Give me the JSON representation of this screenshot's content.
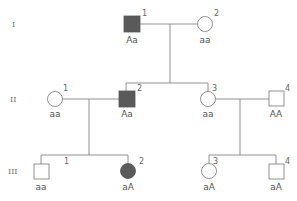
{
  "generations": [
    {
      "label": "I"
    },
    {
      "label": "II"
    },
    {
      "label": "III"
    }
  ],
  "individuals": {
    "I1": {
      "number": "1",
      "sex": "male",
      "affected": true,
      "genotype": "Aa"
    },
    "I2": {
      "number": "2",
      "sex": "female",
      "affected": false,
      "genotype": "aa"
    },
    "II1": {
      "number": "1",
      "sex": "female",
      "affected": false,
      "genotype": "aa"
    },
    "II2": {
      "number": "2",
      "sex": "male",
      "affected": true,
      "genotype": "Aa"
    },
    "II3": {
      "number": "3",
      "sex": "female",
      "affected": false,
      "genotype": "aa"
    },
    "II4": {
      "number": "4",
      "sex": "male",
      "affected": false,
      "genotype": "AA"
    },
    "III1": {
      "number": "1",
      "sex": "male",
      "affected": false,
      "genotype": "aa"
    },
    "III2": {
      "number": "2",
      "sex": "female",
      "affected": true,
      "genotype": "aA"
    },
    "III3": {
      "number": "3",
      "sex": "female",
      "affected": false,
      "genotype": "aA"
    },
    "III4": {
      "number": "4",
      "sex": "male",
      "affected": false,
      "genotype": "aA"
    }
  },
  "colors": {
    "affected_fill": "#5a5a5a",
    "line": "#777777"
  }
}
